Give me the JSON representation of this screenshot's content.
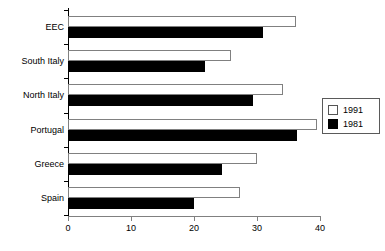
{
  "chart_data": {
    "type": "bar",
    "orientation": "horizontal",
    "title": "",
    "subtitle": "",
    "xlabel": "",
    "ylabel": "",
    "xlim": [
      0,
      40
    ],
    "xticks": [
      0,
      10,
      20,
      30,
      40
    ],
    "xtick_labels": [
      "0",
      "10",
      "20",
      "30",
      "40"
    ],
    "grid": false,
    "legend_position": "right",
    "categories": [
      "EEC",
      "South Italy",
      "North Italy",
      "Portugal",
      "Greece",
      "Spain"
    ],
    "series": [
      {
        "name": "1991",
        "color": "#ffffff",
        "edge_color": "#808080",
        "values": [
          36.2,
          25.9,
          34.1,
          39.5,
          30.0,
          27.3
        ]
      },
      {
        "name": "1981",
        "color": "#000000",
        "edge_color": "#000000",
        "values": [
          31.0,
          21.7,
          29.4,
          36.3,
          24.4,
          20.0
        ]
      }
    ]
  },
  "legend": {
    "entries": [
      {
        "label": "1991",
        "swatch": "white-square-icon"
      },
      {
        "label": "1981",
        "swatch": "black-square-icon"
      }
    ]
  },
  "caption": {
    "ghost_text": ""
  }
}
